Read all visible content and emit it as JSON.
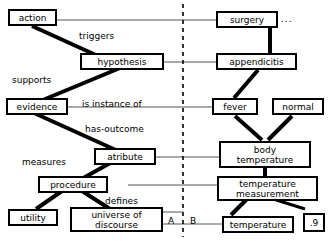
{
  "diagram": {
    "divider": {
      "type": "dashed-vertical",
      "label_left": "A",
      "label_right": "B"
    },
    "colors": {
      "stroke": "#000000",
      "fill": "#ffffff",
      "thin_line": "#555555"
    },
    "nodes": [
      {
        "id": "action",
        "label": "action"
      },
      {
        "id": "hypothesis",
        "label": "hypothesis"
      },
      {
        "id": "evidence",
        "label": "evidence"
      },
      {
        "id": "atribute",
        "label": "atribute"
      },
      {
        "id": "procedure",
        "label": "procedure"
      },
      {
        "id": "utility",
        "label": "utility"
      },
      {
        "id": "universe_of_discourse",
        "label": "universe of\ndiscourse"
      },
      {
        "id": "surgery",
        "label": "surgery"
      },
      {
        "id": "appendicitis",
        "label": "appendicitis"
      },
      {
        "id": "fever",
        "label": "fever"
      },
      {
        "id": "normal",
        "label": "normal"
      },
      {
        "id": "body_temperature",
        "label": "body\ntemperature"
      },
      {
        "id": "temperature_measurement",
        "label": "temperature\nmeasurement"
      },
      {
        "id": "temperature",
        "label": "temperature"
      },
      {
        "id": "certainty",
        "label": ".9"
      }
    ],
    "edge_labels": [
      {
        "id": "triggers",
        "text": "triggers"
      },
      {
        "id": "supports",
        "text": "supports"
      },
      {
        "id": "is_instance_of",
        "text": "is instance of"
      },
      {
        "id": "has_outcome",
        "text": "has-outcome"
      },
      {
        "id": "measures",
        "text": "measures"
      },
      {
        "id": "defines",
        "text": "defines"
      }
    ],
    "ellipsis": "..."
  }
}
